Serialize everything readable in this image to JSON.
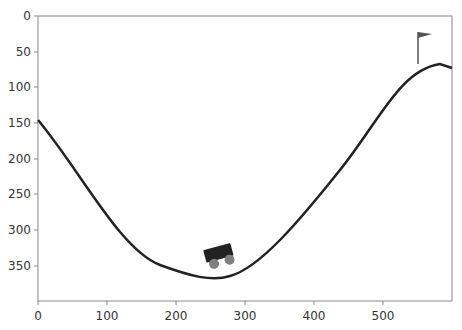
{
  "environment": "MountainCar",
  "axes": {
    "x_ticks": [
      "0",
      "100",
      "200",
      "300",
      "400",
      "500"
    ],
    "y_ticks": [
      "0",
      "50",
      "100",
      "150",
      "200",
      "250",
      "300",
      "350"
    ],
    "xlim": [
      0,
      600
    ],
    "ylim": [
      400,
      0
    ]
  },
  "scene": {
    "track_color": "#222222",
    "car_body_color": "#222222",
    "wheel_color": "#7f7f7f",
    "flag_color": "#555555",
    "car_position_px": [
      220,
      258
    ],
    "flag_position_px": [
      418,
      32
    ]
  }
}
